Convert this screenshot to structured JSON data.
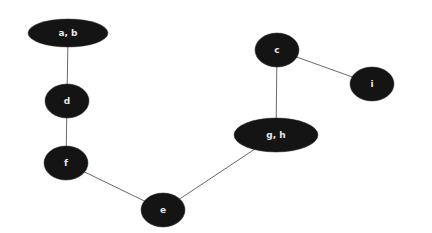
{
  "diagram": {
    "type": "undirected-graph",
    "width": 432,
    "height": 233,
    "colors": {
      "background": "#ffffff",
      "node_fill": "#141414",
      "node_text": "#e8e8e8",
      "edge": "#6a6a6a"
    },
    "nodes": [
      {
        "id": "ab",
        "label": "a, b",
        "cx": 68,
        "cy": 33,
        "rx": 40,
        "ry": 14
      },
      {
        "id": "d",
        "label": "d",
        "cx": 67,
        "cy": 101,
        "rx": 22,
        "ry": 17
      },
      {
        "id": "f",
        "label": "f",
        "cx": 66,
        "cy": 163,
        "rx": 22,
        "ry": 17
      },
      {
        "id": "e",
        "label": "e",
        "cx": 163,
        "cy": 210,
        "rx": 22,
        "ry": 17
      },
      {
        "id": "gh",
        "label": "g, h",
        "cx": 276,
        "cy": 135,
        "rx": 42,
        "ry": 17
      },
      {
        "id": "c",
        "label": "c",
        "cx": 277,
        "cy": 50,
        "rx": 22,
        "ry": 17
      },
      {
        "id": "i",
        "label": "i",
        "cx": 372,
        "cy": 84,
        "rx": 22,
        "ry": 17
      }
    ],
    "edges": [
      {
        "from": "ab",
        "to": "d"
      },
      {
        "from": "d",
        "to": "f"
      },
      {
        "from": "f",
        "to": "e"
      },
      {
        "from": "e",
        "to": "gh"
      },
      {
        "from": "gh",
        "to": "c"
      },
      {
        "from": "c",
        "to": "i"
      }
    ]
  }
}
